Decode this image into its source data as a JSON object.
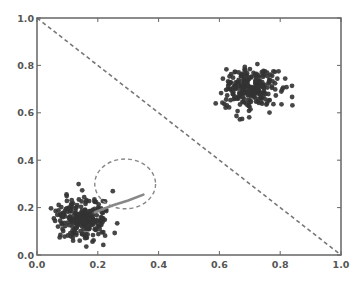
{
  "chart_data": {
    "type": "scatter",
    "title": "",
    "xlabel": "",
    "ylabel": "",
    "xlim": [
      0.0,
      1.0
    ],
    "ylim": [
      0.0,
      1.0
    ],
    "grid": false,
    "legend": null,
    "x_ticks": [
      "0.0",
      "0.2",
      "0.4",
      "0.6",
      "0.8",
      "1.0"
    ],
    "y_ticks": [
      "0.0",
      "0.2",
      "0.4",
      "0.6",
      "0.8",
      "1.0"
    ],
    "series": [
      {
        "name": "cluster-upper-right",
        "kind": "gaussian-cluster",
        "center": [
          0.7,
          0.7
        ],
        "std": [
          0.045,
          0.045
        ],
        "count": 250,
        "marker_color": "#333333",
        "seed": 7
      },
      {
        "name": "cluster-lower-left",
        "kind": "gaussian-cluster",
        "center": [
          0.15,
          0.15
        ],
        "std": [
          0.045,
          0.045
        ],
        "count": 250,
        "marker_color": "#333333",
        "seed": 13
      }
    ],
    "annotations": [
      {
        "name": "diagonal-line",
        "type": "line",
        "style": "dashed",
        "from": [
          0.0,
          1.0
        ],
        "to": [
          1.0,
          0.0
        ],
        "color": "#777777"
      },
      {
        "name": "uncertainty-ellipse",
        "type": "ellipse",
        "style": "dashed",
        "center": [
          0.29,
          0.3
        ],
        "radius": [
          0.1,
          0.105
        ],
        "color": "#888888"
      },
      {
        "name": "trajectory-line",
        "type": "curve",
        "style": "solid",
        "points": [
          [
            0.19,
            0.18
          ],
          [
            0.25,
            0.21
          ],
          [
            0.3,
            0.23
          ],
          [
            0.35,
            0.255
          ]
        ],
        "color": "#888888"
      }
    ]
  },
  "colors": {
    "axis": "#666666",
    "tick_label": "#555555",
    "marker": "#333333",
    "background": "#ffffff"
  }
}
